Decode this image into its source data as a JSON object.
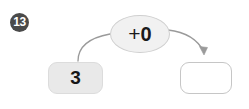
{
  "item": {
    "number_label": "13"
  },
  "machine": {
    "operator_sign": "+",
    "operator_operand": "0",
    "operator_label": "+0",
    "input_value": "3",
    "output_value": "",
    "output_placeholder": ""
  },
  "colors": {
    "background": "#ffffff",
    "badge_fill": "#4a4a4a",
    "badge_text": "#ffffff",
    "oval_fill": "#f1f1f1",
    "oval_border": "#cfcfcf",
    "input_box_fill": "#e9e9e9",
    "input_box_border": "#dcdcdc",
    "output_box_fill": "#ffffff",
    "output_box_border": "#c6c6c6",
    "arrow_stroke": "#9a9a9a",
    "text": "#161616"
  },
  "icons": {
    "arrow_in": "curved-arrow-up-right-icon",
    "arrow_out": "curved-arrow-down-right-icon"
  }
}
